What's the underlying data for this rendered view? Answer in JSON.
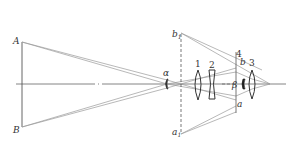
{
  "diagram": {
    "type": "optical-ray-diagram",
    "labels": {
      "A": "A",
      "B": "B",
      "alpha": "α",
      "beta": "β",
      "b1": "b",
      "b1_sub": "1",
      "a1": "a",
      "a1_sub": "1",
      "b": "b",
      "a": "a",
      "n1": "1",
      "n2": "2",
      "n3": "3",
      "n4": "4"
    },
    "colors": {
      "line": "#555555",
      "ray": "#9a9a9a",
      "lens": "#333333",
      "background": "#ffffff"
    }
  }
}
